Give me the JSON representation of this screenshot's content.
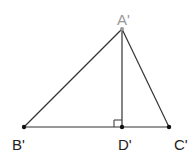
{
  "diagram": {
    "type": "triangle-with-altitude",
    "points": {
      "A": {
        "label": "A'",
        "x": 122,
        "y": 29,
        "color": "#999999"
      },
      "B": {
        "label": "B'",
        "x": 24,
        "y": 127,
        "color": "#111111"
      },
      "C": {
        "label": "C'",
        "x": 169,
        "y": 127,
        "color": "#111111"
      },
      "D": {
        "label": "D'",
        "x": 122,
        "y": 127,
        "color": "#111111"
      }
    },
    "segments": [
      {
        "from": "A",
        "to": "B"
      },
      {
        "from": "A",
        "to": "C"
      },
      {
        "from": "B",
        "to": "C"
      },
      {
        "from": "A",
        "to": "D"
      }
    ],
    "right_angle_at": "D",
    "line_color": "#333333"
  }
}
